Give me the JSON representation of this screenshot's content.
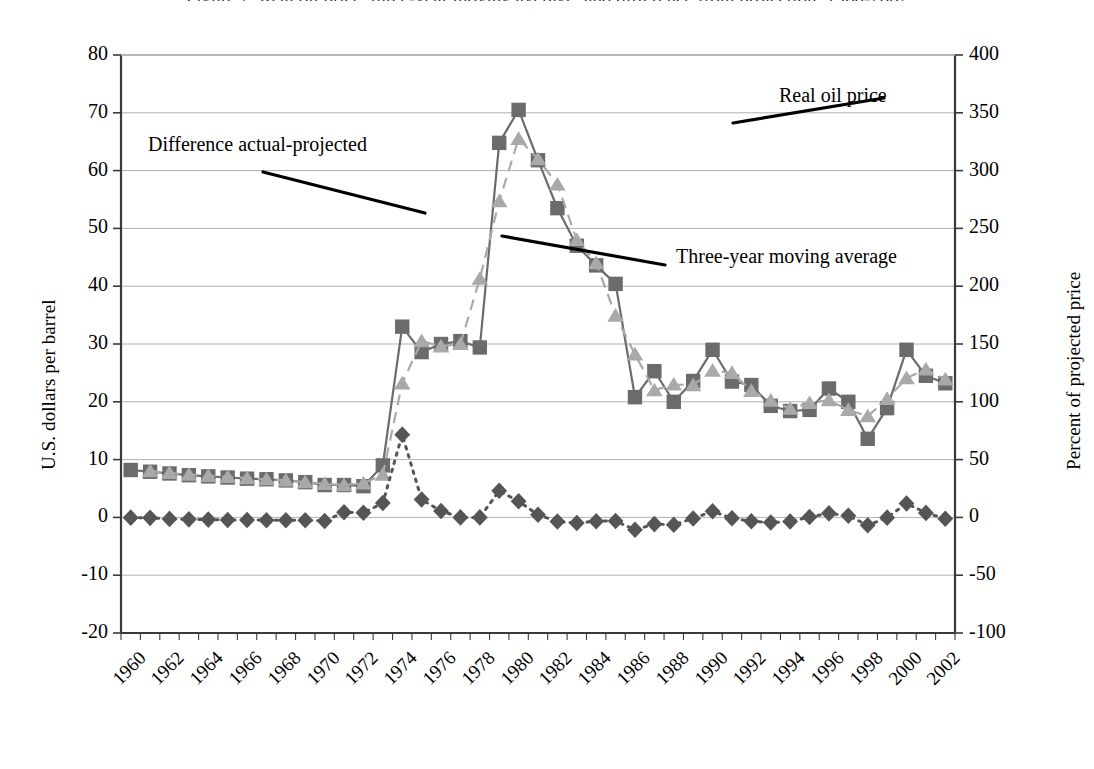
{
  "title_remnant": "Figure 2.  Real oil price, three-year moving average, and difference from projection, 1960-2002",
  "axes": {
    "left_title": "U.S. dollars per barrel",
    "right_title": "Percent of projected price",
    "left_ticks": [
      "80",
      "70",
      "60",
      "50",
      "40",
      "30",
      "20",
      "10",
      "0",
      "-10",
      "-20"
    ],
    "right_ticks": [
      "400",
      "350",
      "300",
      "250",
      "200",
      "150",
      "100",
      "50",
      "0",
      "-50",
      "-100"
    ],
    "x_ticks": [
      "1960",
      "1962",
      "1964",
      "1966",
      "1968",
      "1970",
      "1972",
      "1974",
      "1976",
      "1978",
      "1980",
      "1982",
      "1984",
      "1986",
      "1988",
      "1990",
      "1992",
      "1994",
      "1996",
      "1998",
      "2000",
      "2002"
    ]
  },
  "annotations": [
    {
      "name": "annotation-difference",
      "text": "Difference actual-projected"
    },
    {
      "name": "annotation-real-oil-price",
      "text": "Real  oil price"
    },
    {
      "name": "annotation-three-year-moving-average",
      "text": "Three-year moving average"
    }
  ],
  "colors": {
    "real_oil_price": "#6b6b6b",
    "moving_average": "#a9a9a9",
    "difference": "#555555",
    "gridline": "#b0b0b0",
    "axis": "#3a3a3a",
    "background": "#ffffff"
  },
  "chart_data": {
    "type": "line",
    "title": "",
    "xlabel": "",
    "ylabel": "U.S. dollars per barrel",
    "y2label": "Percent of projected price",
    "ylim": [
      -20,
      80
    ],
    "y2lim": [
      -100,
      400
    ],
    "ytick_step": 10,
    "y2tick_step": 50,
    "grid": true,
    "legend": "annotations with leader lines",
    "x": [
      1960,
      1961,
      1962,
      1963,
      1964,
      1965,
      1966,
      1967,
      1968,
      1969,
      1970,
      1971,
      1972,
      1973,
      1974,
      1975,
      1976,
      1977,
      1978,
      1979,
      1980,
      1981,
      1982,
      1983,
      1984,
      1985,
      1986,
      1987,
      1988,
      1989,
      1990,
      1991,
      1992,
      1993,
      1994,
      1995,
      1996,
      1997,
      1998,
      1999,
      2000,
      2001,
      2002
    ],
    "series": [
      {
        "name": "Real  oil price",
        "axis": "left",
        "marker": "square",
        "linestyle": "solid",
        "color": "#6b6b6b",
        "values": [
          8.2,
          7.9,
          7.6,
          7.3,
          7.1,
          6.9,
          6.7,
          6.6,
          6.4,
          6.1,
          5.6,
          5.6,
          5.4,
          9.0,
          33.0,
          28.6,
          30.0,
          30.5,
          29.4,
          64.8,
          70.5,
          61.8,
          53.5,
          47.0,
          43.6,
          40.4,
          20.8,
          25.3,
          20.0,
          23.6,
          29.0,
          23.5,
          22.9,
          19.3,
          18.4,
          18.6,
          22.3,
          20.0,
          13.6,
          18.9,
          29.0,
          24.5,
          23.2
        ]
      },
      {
        "name": "Three-year moving average",
        "axis": "left",
        "marker": "triangle",
        "linestyle": "dashed",
        "color": "#a9a9a9",
        "values": [
          null,
          8.0,
          7.7,
          7.4,
          7.2,
          7.0,
          6.8,
          6.6,
          6.4,
          6.1,
          5.8,
          5.6,
          5.9,
          7.4,
          23.2,
          30.5,
          29.6,
          30.0,
          41.3,
          54.7,
          65.5,
          62.0,
          57.6,
          48.0,
          44.0,
          34.9,
          28.2,
          22.0,
          23.0,
          22.9,
          25.4,
          25.0,
          21.9,
          20.2,
          18.8,
          19.8,
          20.3,
          18.6,
          17.5,
          20.5,
          24.1,
          25.6,
          23.9
        ]
      },
      {
        "name": "Difference actual-projected",
        "axis": "right",
        "marker": "diamond",
        "linestyle": "dotted",
        "color": "#555555",
        "values": [
          -0.2,
          -0.4,
          -1.3,
          -1.7,
          -1.9,
          -2.2,
          -2.2,
          -2.4,
          -2.5,
          -2.4,
          -3.1,
          4.4,
          4.0,
          12.4,
          71.6,
          15.5,
          5.5,
          0.0,
          0.0,
          23.0,
          13.9,
          2.3,
          -3.6,
          -4.8,
          -3.3,
          -3.1,
          -10.7,
          -5.8,
          -6.3,
          -0.9,
          5.3,
          -0.8,
          -3.4,
          -4.4,
          -3.6,
          0.4,
          3.5,
          1.5,
          -6.8,
          -0.2,
          12.1,
          3.9,
          -1.1
        ]
      }
    ]
  }
}
